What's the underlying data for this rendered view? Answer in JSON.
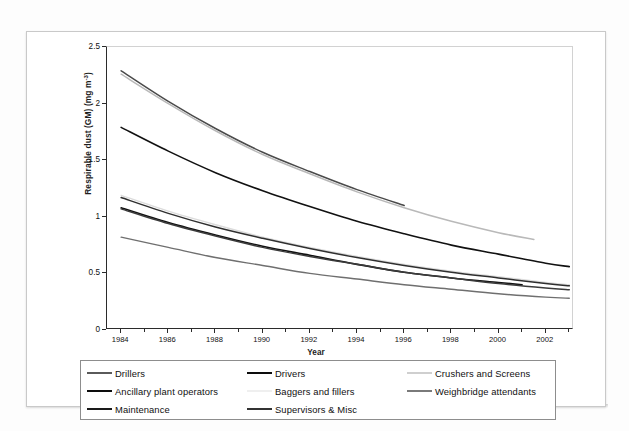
{
  "chart_data": {
    "type": "line",
    "title": "",
    "xlabel": "Year",
    "ylabel": "Respirable dust (GM) (mg m-3)",
    "ylabel_prefix": "Respirable dust (GM) (mg m",
    "ylabel_exponent": "-3",
    "ylabel_suffix": ")",
    "xlim": [
      1983.4,
      2003.2
    ],
    "ylim": [
      0,
      2.5
    ],
    "yticks": [
      "0",
      "0.5",
      "1",
      "1.5",
      "2",
      "2.5"
    ],
    "ytick_values": [
      0,
      0.5,
      1,
      1.5,
      2,
      2.5
    ],
    "xticks": [
      "1984",
      "1986",
      "1988",
      "1990",
      "1992",
      "1994",
      "1996",
      "1998",
      "2000",
      "2002"
    ],
    "xtick_values": [
      1984,
      1986,
      1988,
      1990,
      1992,
      1994,
      1996,
      1998,
      2000,
      2002
    ],
    "xminor_step": 1,
    "grid": false,
    "legend_position": "below",
    "series": [
      {
        "name": "Drillers",
        "color": "#4a4a4a",
        "width": 1.5,
        "x": [
          1984,
          1986,
          1988,
          1990,
          1992,
          1994,
          1996
        ],
        "values": [
          2.29,
          2.02,
          1.78,
          1.57,
          1.4,
          1.24,
          1.1
        ]
      },
      {
        "name": "Drivers",
        "color": "#111111",
        "width": 1.6,
        "x": [
          1984,
          1986,
          1988,
          1990,
          1992,
          1994,
          1996,
          1998,
          2000,
          2002,
          2003
        ],
        "values": [
          1.79,
          1.58,
          1.39,
          1.23,
          1.09,
          0.96,
          0.85,
          0.75,
          0.67,
          0.59,
          0.56
        ]
      },
      {
        "name": "Crushers and Screens",
        "color": "#b9b9b9",
        "width": 1.5,
        "x": [
          1984,
          1986,
          1988,
          1990,
          1992,
          1994,
          1996,
          1998,
          2000,
          2001.5
        ],
        "values": [
          2.26,
          2.0,
          1.76,
          1.55,
          1.38,
          1.22,
          1.08,
          0.96,
          0.86,
          0.8
        ]
      },
      {
        "name": "Ancillary plant operators",
        "color": "#111111",
        "width": 1.6,
        "x": [
          1984,
          1986,
          1988,
          1990,
          1992,
          1994,
          1996,
          1998,
          2000,
          2001
        ],
        "values": [
          1.08,
          0.95,
          0.84,
          0.74,
          0.66,
          0.58,
          0.51,
          0.46,
          0.42,
          0.4
        ]
      },
      {
        "name": "Baggers and fillers",
        "color": "#dcdcdc",
        "width": 1.4,
        "x": [
          1984,
          1986,
          1988,
          1990,
          1992,
          1994,
          1996,
          1998,
          2000,
          2002,
          2003
        ],
        "values": [
          1.19,
          1.05,
          0.93,
          0.82,
          0.73,
          0.65,
          0.58,
          0.52,
          0.47,
          0.42,
          0.4
        ]
      },
      {
        "name": "Weighbridge attendants",
        "color": "#6f6f6f",
        "width": 1.4,
        "x": [
          1984,
          1986,
          1988,
          1990,
          1992,
          1994,
          1996,
          1998,
          2000,
          2002,
          2003
        ],
        "values": [
          0.82,
          0.73,
          0.64,
          0.57,
          0.5,
          0.45,
          0.4,
          0.36,
          0.32,
          0.29,
          0.28
        ]
      },
      {
        "name": "Maintenance",
        "color": "#2f2f2f",
        "width": 1.5,
        "x": [
          1984,
          1986,
          1988,
          1990,
          1992,
          1994,
          1996,
          1998,
          2000,
          2002,
          2003
        ],
        "values": [
          1.17,
          1.03,
          0.91,
          0.81,
          0.72,
          0.64,
          0.57,
          0.51,
          0.46,
          0.41,
          0.39
        ]
      },
      {
        "name": "Supervisors & Misc",
        "color": "#3b3b3b",
        "width": 1.5,
        "x": [
          1984,
          1986,
          1988,
          1990,
          1992,
          1994,
          1996,
          1998,
          2000,
          2002,
          2003
        ],
        "values": [
          1.07,
          0.94,
          0.83,
          0.73,
          0.65,
          0.58,
          0.51,
          0.46,
          0.41,
          0.37,
          0.355
        ]
      }
    ]
  },
  "legend": {
    "items": [
      {
        "label": "Drillers",
        "color": "#5a5a5a"
      },
      {
        "label": "Drivers",
        "color": "#0d0d0d"
      },
      {
        "label": "Crushers and Screens",
        "color": "#cfcfcf"
      },
      {
        "label": "Ancillary plant operators",
        "color": "#0d0d0d"
      },
      {
        "label": "Baggers and fillers",
        "color": "#efefef"
      },
      {
        "label": "Weighbridge attendants",
        "color": "#7a7a7a"
      },
      {
        "label": "Maintenance",
        "color": "#1a1a1a"
      },
      {
        "label": "Supervisors & Misc",
        "color": "#333333"
      }
    ]
  }
}
